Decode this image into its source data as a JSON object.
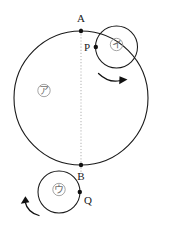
{
  "figure": {
    "kind": "geometry-diagram",
    "background_color": "#ffffff",
    "width": 171,
    "height": 225,
    "stroke_color": "#1a1a1a",
    "dotted_line_color": "#b9b9b9",
    "label_color": "#6e6e6e"
  },
  "points": {
    "a": {
      "label": "A",
      "x": 81,
      "y": 31
    },
    "b": {
      "label": "B",
      "x": 81,
      "y": 165
    },
    "p": {
      "label": "P",
      "x": 95.5,
      "y": 47
    },
    "q": {
      "label": "Q",
      "x": 80,
      "y": 192
    }
  },
  "circles": {
    "large": {
      "label": "ア",
      "center_x": 81,
      "center_y": 98,
      "radius": 67,
      "label_x": 44,
      "label_y": 94
    },
    "upper_small": {
      "label": "イ",
      "center_x": 116.5,
      "center_y": 47,
      "radius": 21,
      "label_x": 116.5,
      "label_y": 48
    },
    "lower_small": {
      "label": "ウ",
      "center_x": 59,
      "center_y": 192,
      "radius": 21,
      "label_x": 59,
      "label_y": 193
    }
  },
  "arrows": {
    "upper": {
      "name": "clockwise-rotation-arrow",
      "direction": "clockwise"
    },
    "lower": {
      "name": "counterclockwise-rotation-arrow",
      "direction": "counterclockwise"
    }
  }
}
